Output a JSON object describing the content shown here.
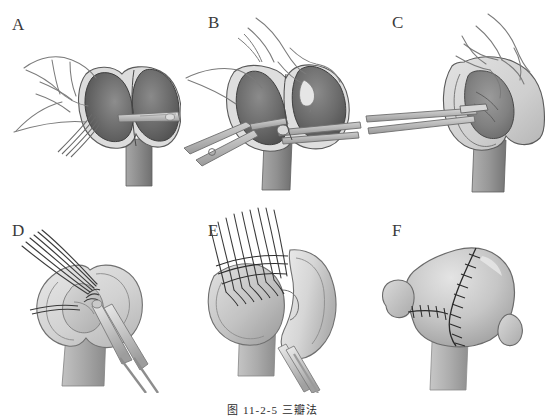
{
  "figure": {
    "caption": "图 11-2-5  三瓣法",
    "background_color": "#ffffff",
    "palette": {
      "ink_outline": "#4a4a4a",
      "dark_tissue": "#6f6f6f",
      "mid_tissue": "#9a9a9a",
      "light_tissue": "#c9c9c9",
      "pale_tissue": "#dedede",
      "instrument_steel": "#b8b8b8",
      "suture_thread": "#3a3a3a",
      "label_color": "#3a3a3a",
      "skin_line": "#7d7d7d"
    }
  },
  "panels": [
    {
      "id": "panel-a",
      "label": "A",
      "label_x": 12,
      "label_y": 16,
      "title": "hand retracting bilobed organ while scalpel makes transverse incision",
      "elements": [
        "surgeon-hand",
        "left-lobe-dark",
        "right-lobe-dark",
        "pale-rim",
        "scalpel-blade",
        "organ-shaft"
      ]
    },
    {
      "id": "panel-b",
      "label": "B",
      "label_x": 26,
      "label_y": 14,
      "title": "hand holds tissue while scissors and forceps dissect the flap",
      "elements": [
        "surgeon-hand",
        "scissors-instrument",
        "forceps-instrument",
        "dark-tissue-mass",
        "pale-rim",
        "organ-shaft"
      ]
    },
    {
      "id": "panel-c",
      "label": "C",
      "label_x": 28,
      "label_y": 14,
      "title": "forceps enter opened cavity held apart by the hand",
      "elements": [
        "surgeon-hand",
        "forceps-instrument",
        "opened-cavity",
        "pale-rim",
        "organ-shaft"
      ]
    },
    {
      "id": "panel-d",
      "label": "D",
      "label_x": 12,
      "label_y": 24,
      "title": "interrupted sutures placed through flap edge with needle holder",
      "elements": [
        "suture-thread-bundle",
        "needle-holder",
        "flap-tissue",
        "pale-rim",
        "organ-shaft"
      ]
    },
    {
      "id": "panel-e",
      "label": "E",
      "label_x": 26,
      "label_y": 24,
      "title": "row of parallel sutures tied along the flap margin",
      "elements": [
        "suture-thread-row",
        "flap-tissue",
        "curved-flap",
        "needle-holder",
        "organ-shaft"
      ]
    },
    {
      "id": "panel-f",
      "label": "F",
      "label_x": 28,
      "label_y": 24,
      "title": "completed closure showing final suture lines",
      "elements": [
        "closed-organ-body",
        "main-suture-line",
        "secondary-suture-line",
        "organ-shaft"
      ]
    }
  ]
}
